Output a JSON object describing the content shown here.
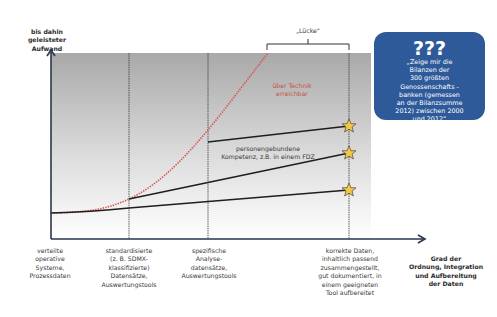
{
  "y_axis": {
    "label_line1": "bis dahin",
    "label_line2": "geleisteter Aufwand"
  },
  "x_axis": {
    "label": [
      "Grad der",
      "Ordnung, Integration",
      "und Aufbereitung",
      "der Daten"
    ]
  },
  "gap": {
    "label": "„Lücke“"
  },
  "red_curve": {
    "label": [
      "über Technik",
      "erreichbar"
    ],
    "color": "#d9534f"
  },
  "mid_label": [
    "personengebundene",
    "Kompetenz, z.B. in einem FDZ"
  ],
  "x_stages": [
    {
      "lines": [
        "verteilte",
        "operative",
        "Systeme,",
        "Prozessdaten"
      ]
    },
    {
      "lines": [
        "standardisierte",
        "(z. B. SDMX-",
        "klassifizierte)",
        "Datensätze,",
        "Auswertungstools"
      ]
    },
    {
      "lines": [
        "spezifische",
        "Analyse-",
        "datensätze,",
        "Auswertungstools"
      ]
    },
    {
      "lines": [
        "korrekte Daten,",
        "inhaltlich passend",
        "zusammengestellt,",
        "gut dokumentiert, in",
        "einem geeigneten",
        "Tool aufbereitet"
      ]
    }
  ],
  "callout": {
    "title": "???",
    "lines": [
      "„Zeige mir die",
      "Bilanzen der",
      "300 größten",
      "Genossenschafts -",
      "banken (gemessen",
      "an der Bilanzsumme",
      "2012) zwischen 2000",
      "und 2012“"
    ],
    "color": "#2e5a9a"
  },
  "colors": {
    "star": "#f2c744",
    "line": "#1e1e1e",
    "axis": "#2a3550"
  }
}
